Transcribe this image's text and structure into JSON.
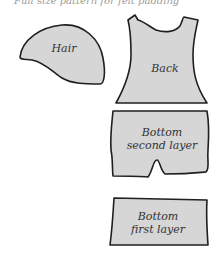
{
  "caption": "Full size pattern for felt padding",
  "pieces": [
    {
      "id": "hair",
      "label": "Hair"
    },
    {
      "id": "back",
      "label": "Back"
    },
    {
      "id": "bottom_second",
      "label_line1": "Bottom",
      "label_line2": "second layer"
    },
    {
      "id": "bottom_first",
      "label_line1": "Bottom",
      "label_line2": "first layer"
    }
  ],
  "colors": {
    "fill": "#d6d6d6",
    "stroke": "#1f1f1f",
    "background": "#ffffff"
  }
}
